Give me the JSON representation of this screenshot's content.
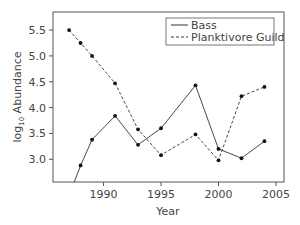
{
  "chart_data": {
    "type": "line",
    "title": "",
    "xlabel": "Year",
    "ylabel": "log10 Abundance",
    "ylabel_parts": {
      "prefix": "log",
      "subscript": "10",
      "suffix": " Abundance"
    },
    "xlim": [
      1985.6,
      2005.7
    ],
    "ylim": [
      2.56,
      5.85
    ],
    "x_ticks": [
      1990,
      1995,
      2000,
      2005
    ],
    "x_tick_labels": [
      "1990",
      "1995",
      "2000",
      "2005"
    ],
    "y_ticks": [
      3.0,
      3.5,
      4.0,
      4.5,
      5.0,
      5.5
    ],
    "y_tick_labels": [
      "3.0",
      "3.5",
      "4.0",
      "4.5",
      "5.0",
      "5.5"
    ],
    "grid": false,
    "legend_position": "upper right",
    "series": [
      {
        "name": "Bass",
        "style": "solid",
        "x": [
          1987,
          1988,
          1989,
          1991,
          1993,
          1995,
          1998,
          2000,
          2002,
          2004
        ],
        "values": [
          2.3,
          2.88,
          3.38,
          3.84,
          3.28,
          3.6,
          4.43,
          3.2,
          3.02,
          3.35
        ],
        "markers": [
          false,
          true,
          true,
          true,
          true,
          true,
          true,
          true,
          true,
          true
        ]
      },
      {
        "name": "Planktivore Guild",
        "style": "dashed",
        "x": [
          1987,
          1988,
          1989,
          1991,
          1993,
          1995,
          1998,
          2000,
          2002,
          2004
        ],
        "values": [
          5.5,
          5.25,
          5.0,
          4.47,
          3.58,
          3.08,
          3.48,
          2.98,
          4.22,
          4.4
        ],
        "markers": [
          true,
          true,
          true,
          true,
          true,
          true,
          true,
          true,
          true,
          true
        ]
      }
    ]
  },
  "legend": {
    "items": [
      {
        "label": "Bass"
      },
      {
        "label": "Planktivore Guild"
      }
    ]
  },
  "colors": {
    "line": "#333333",
    "frame": "#555555",
    "text": "#444444"
  }
}
